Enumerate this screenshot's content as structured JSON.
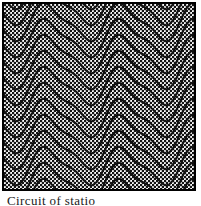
{
  "figure": {
    "kind": "contour-wave-plot",
    "caption_text": "Circuit of statio",
    "frame": {
      "x": 2,
      "y": 2,
      "width": 194,
      "height": 189,
      "border_width": 2,
      "border_color": "#000000",
      "fill_color": "#ffffff"
    },
    "stipple": {
      "name": "halftone-dot-fill",
      "dot_color": "#141414",
      "background_color": "#ffffff",
      "period": 4,
      "dot_size": 1.35
    },
    "curve_style": {
      "stroke_color": "#111111",
      "stroke_width": 2,
      "fill": "none"
    }
  },
  "chart_data": {
    "type": "line",
    "title": "",
    "subtitle": "",
    "xlabel": "",
    "ylabel": "",
    "grid": false,
    "legend": "none",
    "xlim": [
      0,
      201
    ],
    "ylim": [
      0,
      206
    ],
    "plot_area": {
      "left": 4,
      "top": 4,
      "right": 194,
      "bottom": 189
    },
    "wave": {
      "period": 75,
      "amplitude": 22,
      "phase_offset_x": 30,
      "crest_sharpness": 0.32,
      "vertical_spacing": 16,
      "sample_step": 2
    },
    "series": [
      {
        "name": "contour-01",
        "baseline_y": -14
      },
      {
        "name": "contour-02",
        "baseline_y": 2
      },
      {
        "name": "contour-03",
        "baseline_y": 18
      },
      {
        "name": "contour-04",
        "baseline_y": 34
      },
      {
        "name": "contour-05",
        "baseline_y": 50
      },
      {
        "name": "contour-06",
        "baseline_y": 66
      },
      {
        "name": "contour-07",
        "baseline_y": 82
      },
      {
        "name": "contour-08",
        "baseline_y": 98
      },
      {
        "name": "contour-09",
        "baseline_y": 114
      },
      {
        "name": "contour-10",
        "baseline_y": 130
      },
      {
        "name": "contour-11",
        "baseline_y": 146
      },
      {
        "name": "contour-12",
        "baseline_y": 162
      },
      {
        "name": "contour-13",
        "baseline_y": 178
      },
      {
        "name": "contour-14",
        "baseline_y": 194
      }
    ]
  }
}
